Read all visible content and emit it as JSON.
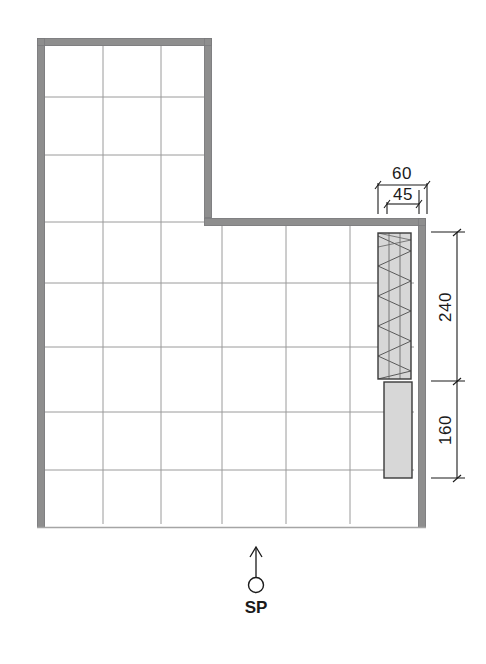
{
  "drawing": {
    "type": "architectural-floor-plan",
    "shape": "L-shaped room with grid tiling",
    "background_color": "#ffffff",
    "wall_color": "#8e8e8e",
    "wall_edge_color": "#6f6f6f",
    "grid_line_color": "#9a9a9a",
    "fixture_fill_color": "#d7d7d7",
    "fixture_outline_color": "#3a3a3a",
    "hatch_line_color": "#555555",
    "dimension_line_color": "#1a1a1a",
    "text_color": "#1a1a1a"
  },
  "dimensions": {
    "horizontal": [
      {
        "id": "dim-60",
        "label": "60",
        "orientation": "horizontal",
        "position": "above-fixture-outer"
      },
      {
        "id": "dim-45",
        "label": "45",
        "orientation": "horizontal",
        "position": "above-fixture-inner"
      }
    ],
    "vertical": [
      {
        "id": "dim-240",
        "label": "240",
        "orientation": "vertical",
        "position": "right-upper-fixture"
      },
      {
        "id": "dim-160",
        "label": "160",
        "orientation": "vertical",
        "position": "right-lower-fixture"
      }
    ]
  },
  "annotations": {
    "sp_marker": {
      "label": "SP",
      "icon": "arrow-up-with-circle",
      "description": "Standing point / viewing direction marker below plan"
    }
  },
  "fixtures": [
    {
      "id": "fixture-hatched-upper",
      "name": "hatched-fixture",
      "fill": "#d7d7d7",
      "hatch": "zigzag-diagonal",
      "dimension_label": "240"
    },
    {
      "id": "fixture-plain-lower",
      "name": "plain-fixture",
      "fill": "#d7d7d7",
      "hatch": "none",
      "dimension_label": "160"
    }
  ],
  "grid": {
    "vertical_x": [
      57,
      121,
      185,
      249,
      313,
      377
    ],
    "horizontal_y": [
      110,
      165,
      230,
      285,
      340,
      395,
      450,
      505
    ],
    "note": "tile module grid lines"
  }
}
